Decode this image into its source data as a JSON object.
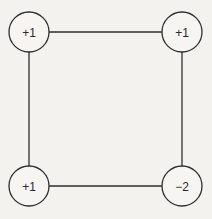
{
  "diagram": {
    "colors": {
      "stroke": "#2e2e2e",
      "node_fill": "#f7f5f2",
      "background": "#f4f2ef"
    },
    "nodes": [
      {
        "id": "top-left",
        "label": "+1",
        "cx": 29,
        "cy": 32
      },
      {
        "id": "top-right",
        "label": "+1",
        "cx": 182,
        "cy": 32
      },
      {
        "id": "bottom-left",
        "label": "+1",
        "cx": 29,
        "cy": 186
      },
      {
        "id": "bottom-right",
        "label": "−2",
        "cx": 182,
        "cy": 186
      }
    ],
    "edges": [
      {
        "from": "top-left",
        "to": "top-right"
      },
      {
        "from": "top-right",
        "to": "bottom-right"
      },
      {
        "from": "bottom-right",
        "to": "bottom-left"
      },
      {
        "from": "bottom-left",
        "to": "top-left"
      }
    ]
  }
}
